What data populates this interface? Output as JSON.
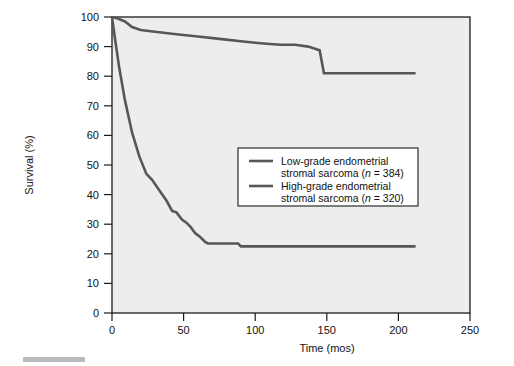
{
  "figure": {
    "background_color": "#ffffff",
    "plot_background_color": "#eceded",
    "line_color": "#575757",
    "axis_color": "#1b1b1b"
  },
  "axes": {
    "x": {
      "title": "Time (mos)",
      "min": 0,
      "max": 250,
      "ticks": [
        0,
        50,
        100,
        150,
        200,
        250
      ],
      "tick_labels": [
        "0",
        "50",
        "100",
        "150",
        "200",
        "250"
      ]
    },
    "y": {
      "title": "Survival (%)",
      "min": 0,
      "max": 100,
      "ticks": [
        0,
        10,
        20,
        30,
        40,
        50,
        60,
        70,
        80,
        90,
        100
      ],
      "tick_labels": [
        "0",
        "10",
        "20",
        "30",
        "40",
        "50",
        "60",
        "70",
        "80",
        "90",
        "100"
      ]
    }
  },
  "legend": {
    "entries": [
      {
        "line1": "Low-grade endometrial",
        "line2_pre": "stromal sarcoma (",
        "line2_ital": "n",
        "line2_post": " = 384)"
      },
      {
        "line1": "High-grade endometrial",
        "line2_pre": "stromal sarcoma (",
        "line2_ital": "n",
        "line2_post": " = 320)"
      }
    ]
  },
  "chart_data": {
    "type": "line",
    "title": "",
    "xlabel": "Time (mos)",
    "ylabel": "Survival (%)",
    "xlim": [
      0,
      250
    ],
    "ylim": [
      0,
      100
    ],
    "grid": false,
    "legend_position": "center-right-inside",
    "series": [
      {
        "name": "Low-grade endometrial stromal sarcoma (n = 384)",
        "n": 384,
        "color": "#575757",
        "points": [
          [
            0,
            100
          ],
          [
            4,
            99.5
          ],
          [
            9,
            98.5
          ],
          [
            14,
            96.6
          ],
          [
            20,
            95.6
          ],
          [
            30,
            95.0
          ],
          [
            45,
            94.2
          ],
          [
            60,
            93.4
          ],
          [
            75,
            92.6
          ],
          [
            90,
            91.8
          ],
          [
            100,
            91.3
          ],
          [
            110,
            90.9
          ],
          [
            118,
            90.6
          ],
          [
            128,
            90.6
          ],
          [
            137,
            90.0
          ],
          [
            145,
            88.8
          ],
          [
            148,
            81.0
          ],
          [
            175,
            81.0
          ],
          [
            200,
            81.0
          ],
          [
            212,
            81.0
          ]
        ]
      },
      {
        "name": "High-grade endometrial stromal sarcoma (n = 320)",
        "n": 320,
        "color": "#575757",
        "points": [
          [
            0,
            100
          ],
          [
            2,
            93.0
          ],
          [
            5,
            83.0
          ],
          [
            9,
            72.0
          ],
          [
            14,
            61.0
          ],
          [
            19,
            53.0
          ],
          [
            24,
            47.0
          ],
          [
            28,
            45.0
          ],
          [
            33,
            41.5
          ],
          [
            38,
            38.0
          ],
          [
            42,
            34.5
          ],
          [
            45,
            34.0
          ],
          [
            49,
            31.5
          ],
          [
            52,
            30.5
          ],
          [
            55,
            29.0
          ],
          [
            58,
            27.0
          ],
          [
            62,
            25.5
          ],
          [
            65,
            24.0
          ],
          [
            67,
            23.5
          ],
          [
            80,
            23.5
          ],
          [
            88,
            23.5
          ],
          [
            90,
            22.5
          ],
          [
            120,
            22.5
          ],
          [
            160,
            22.5
          ],
          [
            200,
            22.5
          ],
          [
            212,
            22.5
          ]
        ]
      }
    ]
  }
}
